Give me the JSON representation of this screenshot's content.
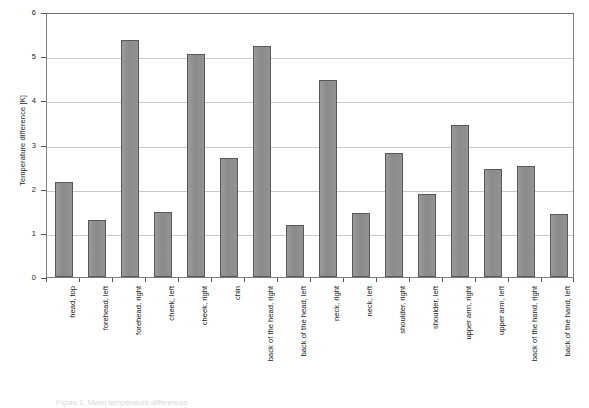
{
  "chart_data": {
    "type": "bar",
    "title": "",
    "xlabel": "",
    "ylabel": "Temperature difference [K]",
    "ylim": [
      0,
      6
    ],
    "ytick_labels": [
      "0",
      "1",
      "2",
      "3",
      "4",
      "5",
      "6"
    ],
    "ytick_values": [
      0,
      1,
      2,
      3,
      4,
      5,
      6
    ],
    "grid": true,
    "legend": false,
    "bar_color": "#8d8d8d",
    "bar_edge_color": "#585858",
    "categories": [
      "head, top",
      "forehead, left",
      "forehead, right",
      "cheek, left",
      "cheek, right",
      "chin",
      "back of the head, right",
      "back of the head, left",
      "neck, right",
      "neck, left",
      "shoulder, right",
      "shoulder, left",
      "upper arm, right",
      "upper arm, left",
      "back of the hand, right",
      "back of the hand, left"
    ],
    "values": [
      2.15,
      1.28,
      5.37,
      1.48,
      5.05,
      2.7,
      5.22,
      1.18,
      4.46,
      1.46,
      2.8,
      1.88,
      3.45,
      2.45,
      2.52,
      1.42
    ]
  },
  "caption": {
    "text": "Figure 1. Mean temperature differences"
  }
}
